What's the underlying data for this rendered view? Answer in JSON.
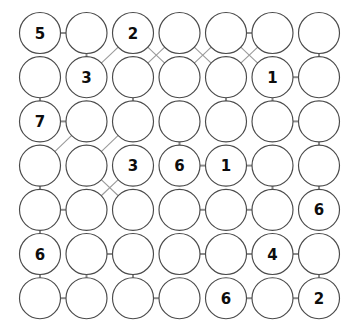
{
  "puzzle": {
    "title": "number-circle-grid-puzzle",
    "rows": 7,
    "cols": 7,
    "geometry": {
      "x0": 40,
      "y0": 33,
      "dx": 46.5,
      "dy": 44.2,
      "radius": 20.5
    },
    "colors": {
      "background": "#ffffff",
      "circle_stroke": "#4a4a4a",
      "circle_fill": "#ffffff",
      "edge_straight": "#8c8c8c",
      "edge_diagonal": "#9a9a9a",
      "label": "#0d0d0d"
    },
    "grid_values": [
      [
        "5",
        "",
        "2",
        "",
        "",
        "",
        ""
      ],
      [
        "",
        "3",
        "",
        "",
        "",
        "1",
        ""
      ],
      [
        "7",
        "",
        "",
        "",
        "",
        "",
        ""
      ],
      [
        "",
        "",
        "3",
        "6",
        "1",
        "",
        ""
      ],
      [
        "",
        "",
        "",
        "",
        "",
        "",
        "6"
      ],
      [
        "6",
        "",
        "",
        "",
        "",
        "4",
        ""
      ],
      [
        "",
        "",
        "",
        "",
        "6",
        "",
        "2"
      ]
    ],
    "edges": [
      {
        "type": "horizontal",
        "r1": 0,
        "c1": 0,
        "r2": 0,
        "c2": 1
      },
      {
        "type": "horizontal",
        "r1": 0,
        "c1": 4,
        "r2": 0,
        "c2": 5
      },
      {
        "type": "vertical",
        "r1": 0,
        "c1": 1,
        "r2": 1,
        "c2": 1
      },
      {
        "type": "diagonal",
        "r1": 0,
        "c1": 2,
        "r2": 1,
        "c2": 1
      },
      {
        "type": "diagonal",
        "r1": 0,
        "c1": 2,
        "r2": 1,
        "c2": 3
      },
      {
        "type": "diagonal",
        "r1": 0,
        "c1": 3,
        "r2": 1,
        "c2": 2
      },
      {
        "type": "diagonal",
        "r1": 0,
        "c1": 3,
        "r2": 1,
        "c2": 4
      },
      {
        "type": "diagonal",
        "r1": 0,
        "c1": 4,
        "r2": 1,
        "c2": 3
      },
      {
        "type": "diagonal",
        "r1": 0,
        "c1": 4,
        "r2": 1,
        "c2": 5
      },
      {
        "type": "diagonal",
        "r1": 0,
        "c1": 5,
        "r2": 1,
        "c2": 4
      },
      {
        "type": "vertical",
        "r1": 0,
        "c1": 6,
        "r2": 1,
        "c2": 6
      },
      {
        "type": "horizontal",
        "r1": 1,
        "c1": 5,
        "r2": 1,
        "c2": 6
      },
      {
        "type": "vertical",
        "r1": 1,
        "c1": 0,
        "r2": 2,
        "c2": 0
      },
      {
        "type": "vertical",
        "r1": 1,
        "c1": 2,
        "r2": 2,
        "c2": 2
      },
      {
        "type": "vertical",
        "r1": 1,
        "c1": 4,
        "r2": 2,
        "c2": 4
      },
      {
        "type": "vertical",
        "r1": 1,
        "c1": 5,
        "r2": 2,
        "c2": 5
      },
      {
        "type": "horizontal",
        "r1": 2,
        "c1": 0,
        "r2": 2,
        "c2": 1
      },
      {
        "type": "horizontal",
        "r1": 2,
        "c1": 5,
        "r2": 2,
        "c2": 6
      },
      {
        "type": "diagonal",
        "r1": 2,
        "c1": 1,
        "r2": 3,
        "c2": 0
      },
      {
        "type": "diagonal",
        "r1": 2,
        "c1": 2,
        "r2": 3,
        "c2": 1
      },
      {
        "type": "vertical",
        "r1": 2,
        "c1": 3,
        "r2": 3,
        "c2": 3
      },
      {
        "type": "vertical",
        "r1": 2,
        "c1": 6,
        "r2": 3,
        "c2": 6
      },
      {
        "type": "horizontal",
        "r1": 3,
        "c1": 3,
        "r2": 3,
        "c2": 4
      },
      {
        "type": "horizontal",
        "r1": 3,
        "c1": 4,
        "r2": 3,
        "c2": 5
      },
      {
        "type": "vertical",
        "r1": 3,
        "c1": 0,
        "r2": 4,
        "c2": 0
      },
      {
        "type": "diagonal",
        "r1": 3,
        "c1": 1,
        "r2": 4,
        "c2": 2
      },
      {
        "type": "diagonal",
        "r1": 3,
        "c1": 2,
        "r2": 4,
        "c2": 1
      },
      {
        "type": "vertical",
        "r1": 3,
        "c1": 5,
        "r2": 4,
        "c2": 5
      },
      {
        "type": "vertical",
        "r1": 3,
        "c1": 6,
        "r2": 4,
        "c2": 6
      },
      {
        "type": "horizontal",
        "r1": 4,
        "c1": 0,
        "r2": 4,
        "c2": 1
      },
      {
        "type": "horizontal",
        "r1": 4,
        "c1": 3,
        "r2": 4,
        "c2": 4
      },
      {
        "type": "horizontal",
        "r1": 4,
        "c1": 4,
        "r2": 4,
        "c2": 5
      },
      {
        "type": "vertical",
        "r1": 4,
        "c1": 0,
        "r2": 5,
        "c2": 0
      },
      {
        "type": "horizontal",
        "r1": 5,
        "c1": 1,
        "r2": 5,
        "c2": 2
      },
      {
        "type": "horizontal",
        "r1": 5,
        "c1": 3,
        "r2": 5,
        "c2": 4
      },
      {
        "type": "horizontal",
        "r1": 5,
        "c1": 4,
        "r2": 5,
        "c2": 5
      },
      {
        "type": "horizontal",
        "r1": 5,
        "c1": 5,
        "r2": 5,
        "c2": 6
      },
      {
        "type": "vertical",
        "r1": 5,
        "c1": 0,
        "r2": 6,
        "c2": 0
      },
      {
        "type": "vertical",
        "r1": 5,
        "c1": 1,
        "r2": 6,
        "c2": 1
      },
      {
        "type": "vertical",
        "r1": 5,
        "c1": 2,
        "r2": 6,
        "c2": 2
      },
      {
        "type": "vertical",
        "r1": 5,
        "c1": 6,
        "r2": 6,
        "c2": 6
      },
      {
        "type": "horizontal",
        "r1": 6,
        "c1": 0,
        "r2": 6,
        "c2": 1
      },
      {
        "type": "horizontal",
        "r1": 6,
        "c1": 2,
        "r2": 6,
        "c2": 3
      },
      {
        "type": "horizontal",
        "r1": 6,
        "c1": 4,
        "r2": 6,
        "c2": 5
      },
      {
        "type": "horizontal",
        "r1": 6,
        "c1": 5,
        "r2": 6,
        "c2": 6
      }
    ]
  }
}
